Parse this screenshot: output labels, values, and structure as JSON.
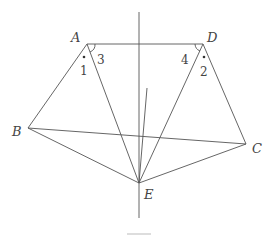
{
  "figure": {
    "points": {
      "A": {
        "label": "A",
        "x": 87,
        "y": 44
      },
      "D": {
        "label": "D",
        "x": 203,
        "y": 44
      },
      "B": {
        "label": "B",
        "x": 28,
        "y": 128
      },
      "C": {
        "label": "C",
        "x": 246,
        "y": 144
      },
      "E": {
        "label": "E",
        "x": 139,
        "y": 183
      }
    },
    "angle_labels": {
      "a1": "1",
      "a2": "2",
      "a3": "3",
      "a4": "4"
    },
    "segments": [
      "AD",
      "AB",
      "AE",
      "DE",
      "DC",
      "BE",
      "CE",
      "BC"
    ],
    "vertical_line": {
      "x": 139,
      "y1": 12,
      "y2": 218
    },
    "extra_ray": {
      "x1": 147,
      "y1": 88,
      "x2": 139,
      "y2": 183
    }
  }
}
